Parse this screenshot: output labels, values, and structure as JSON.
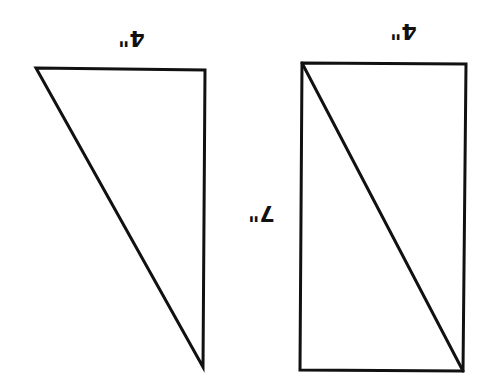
{
  "diagram": {
    "colors": {
      "stroke": "#111111",
      "background": "#ffffff"
    },
    "labels": {
      "triangle_width": "4\"",
      "rectangle_width": "4\"",
      "rectangle_height": "7\""
    },
    "shapes": {
      "triangle": {
        "points": "36,68 205,70 203,367"
      },
      "rectangle": {
        "points": "302,63 466,64 463,371 300,370"
      },
      "rectangle_diagonal": {
        "x1": 302,
        "y1": 63,
        "x2": 463,
        "y2": 371
      }
    }
  }
}
